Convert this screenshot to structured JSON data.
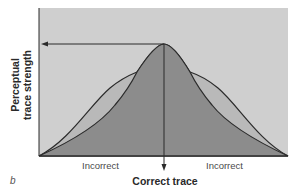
{
  "figure": {
    "panel_label": "b",
    "y_axis_label_line1": "Perceptual",
    "y_axis_label_line2": "trace strength",
    "x_axis_label": "Correct trace",
    "left_region_label": "Incorrect",
    "right_region_label": "Incorrect",
    "colors": {
      "background": "#cfcfcf",
      "outer_fill": "#b9b9b9",
      "inner_fill": "#8c8c8c",
      "stroke": "#2b2b2b"
    }
  }
}
